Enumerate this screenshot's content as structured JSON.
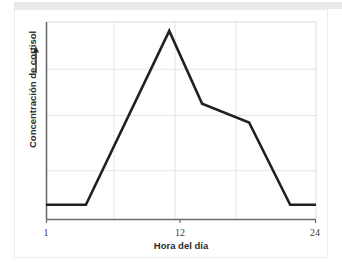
{
  "figure": {
    "background_color": "#ffffff",
    "card_border_color": "#eceded",
    "top_band_color": "#e8e9eb"
  },
  "chart_data": {
    "type": "line",
    "title": "",
    "subtitle": "",
    "xlabel": "Hora del día",
    "ylabel": "Concentración de cortisol",
    "ylabel_arrow": "↑",
    "xlim": [
      1,
      24
    ],
    "ylim": [
      0,
      10
    ],
    "grid": true,
    "grid_color": "#e3e4e6",
    "legend": null,
    "legend_position": "none",
    "axis_color": "#6b6b6b",
    "frame_color": "#6b6b6b",
    "line_color": "#231f20",
    "line_width": 2.6,
    "x_ticks": [
      {
        "value": 1,
        "label": "1"
      },
      {
        "value": 12,
        "label": "12"
      },
      {
        "value": 24,
        "label": "24"
      }
    ],
    "x_gridlines": [
      6.8,
      12,
      17.2
    ],
    "y_ticks": [],
    "y_gridlines": [
      2.45,
      5.25,
      7.6
    ],
    "series": [
      {
        "name": "Cortisol",
        "color": "#231f20",
        "x": [
          1,
          4.4,
          11.5,
          14.3,
          18.3,
          21.8,
          24
        ],
        "y": [
          0.72,
          0.72,
          9.55,
          5.85,
          4.9,
          0.72,
          0.72
        ]
      }
    ],
    "annotations": []
  },
  "axis_labels": {
    "x_title": "Hora del día",
    "y_title": "Concentración de cortisol",
    "x_tick_1": "1",
    "x_tick_12": "12",
    "x_tick_24": "24"
  }
}
